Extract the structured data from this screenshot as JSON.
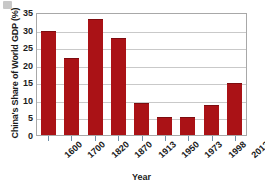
{
  "chart_data": {
    "type": "bar",
    "title": "",
    "xlabel": "Year",
    "ylabel": "China's Share of World GDP (%)",
    "categories": [
      "1600",
      "1700",
      "1820",
      "1870",
      "1913",
      "1950",
      "1973",
      "1998",
      "2012"
    ],
    "values": [
      29.5,
      22.0,
      33.0,
      27.5,
      9.0,
      5.0,
      5.0,
      8.5,
      14.9
    ],
    "ylim": [
      0,
      35
    ],
    "yticks": [
      0,
      5,
      10,
      15,
      20,
      25,
      30,
      35
    ],
    "ytick_labels": [
      "0",
      "5",
      "10",
      "15",
      "20",
      "25",
      "30",
      "35"
    ],
    "grid": true,
    "legend": false,
    "bar_color": "#aa1216",
    "gridline_color": "#c9c9c9",
    "axis_color": "#a8a8a8",
    "background_color": "#ffffff"
  }
}
